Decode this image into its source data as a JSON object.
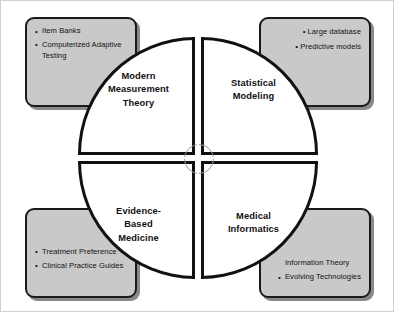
{
  "diagram": {
    "colors": {
      "box_fill": "#c9c9c9",
      "outline": "#1a1a1a",
      "circle_fill": "#ffffff",
      "center_ring": "#9a9a9a",
      "frame": "#d0d0d0"
    },
    "quadrants": [
      {
        "id": "top-left",
        "label": "Modern\nMeasurement\nTheory",
        "line1": "Modern",
        "line2": "Measurement",
        "line3": "Theory"
      },
      {
        "id": "top-right",
        "label": "Statistical\nModeling",
        "line1": "Statistical",
        "line2": "Modeling",
        "line3": ""
      },
      {
        "id": "bottom-left",
        "label": "Evidence-\nBased\nMedicine",
        "line1": "Evidence-",
        "line2": "Based",
        "line3": "Medicine"
      },
      {
        "id": "bottom-right",
        "label": "Medical\nInformatics",
        "line1": "Medical",
        "line2": "Informatics",
        "line3": ""
      }
    ],
    "callouts": [
      {
        "id": "top-left",
        "align": "left",
        "items": [
          "Item Banks",
          "Computerized Adaptive Testing"
        ]
      },
      {
        "id": "top-right",
        "align": "right",
        "items": [
          "Large database",
          "Predictive models"
        ]
      },
      {
        "id": "bottom-left",
        "align": "left",
        "items": [
          "Treatment Preference",
          "Clinical Practice Guides"
        ]
      },
      {
        "id": "bottom-right",
        "align": "left",
        "items": [
          "Information Theory",
          "Evolving Technologies"
        ]
      }
    ]
  }
}
